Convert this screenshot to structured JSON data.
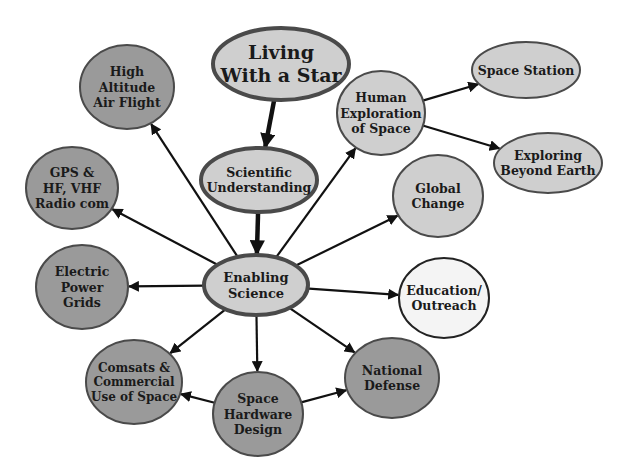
{
  "colors": {
    "dark_fill": "#9a9a9a",
    "light_fill": "#cfcfcf",
    "white_fill": "#f4f4f4",
    "stroke": "#4a4a4a",
    "arrow": "#111111",
    "text": "#1a1a1a"
  },
  "nodes": [
    {
      "id": "living",
      "lines": [
        "Living",
        "With a Star"
      ],
      "cx": 281,
      "cy": 64,
      "rx": 68,
      "ry": 36,
      "fill": "light",
      "size": 19,
      "sw": 4
    },
    {
      "id": "scientific",
      "lines": [
        "Scientific",
        "Understanding"
      ],
      "cx": 259,
      "cy": 180,
      "rx": 58,
      "ry": 32,
      "fill": "light",
      "size": 12.5,
      "sw": 4
    },
    {
      "id": "enabling",
      "lines": [
        "Enabling",
        "Science"
      ],
      "cx": 256,
      "cy": 285,
      "rx": 52,
      "ry": 30,
      "fill": "light",
      "size": 13,
      "sw": 4
    },
    {
      "id": "high-altitude",
      "lines": [
        "High",
        "Altitude",
        "Air Flight"
      ],
      "cx": 127,
      "cy": 87,
      "rx": 47,
      "ry": 42,
      "fill": "dark",
      "size": 12.5,
      "sw": 2
    },
    {
      "id": "gps",
      "lines": [
        "GPS &",
        "HF, VHF",
        "Radio com"
      ],
      "cx": 72,
      "cy": 188,
      "rx": 46,
      "ry": 41,
      "fill": "dark",
      "size": 12.5,
      "sw": 2
    },
    {
      "id": "electric",
      "lines": [
        "Electric",
        "Power",
        "Grids"
      ],
      "cx": 82,
      "cy": 287,
      "rx": 46,
      "ry": 42,
      "fill": "dark",
      "size": 12.5,
      "sw": 2
    },
    {
      "id": "comsats",
      "lines": [
        "Comsats &",
        "Commercial",
        "Use of Space"
      ],
      "cx": 134,
      "cy": 382,
      "rx": 48,
      "ry": 42,
      "fill": "dark",
      "size": 12,
      "sw": 2
    },
    {
      "id": "hardware",
      "lines": [
        "Space",
        "Hardware",
        "Design"
      ],
      "cx": 258,
      "cy": 414,
      "rx": 45,
      "ry": 42,
      "fill": "dark",
      "size": 12.5,
      "sw": 2
    },
    {
      "id": "defense",
      "lines": [
        "National",
        "Defense"
      ],
      "cx": 392,
      "cy": 378,
      "rx": 47,
      "ry": 40,
      "fill": "dark",
      "size": 12.5,
      "sw": 2
    },
    {
      "id": "education",
      "lines": [
        "Education/",
        "Outreach"
      ],
      "cx": 444,
      "cy": 298,
      "rx": 45,
      "ry": 40,
      "fill": "white",
      "size": 12.5,
      "sw": 2
    },
    {
      "id": "global",
      "lines": [
        "Global",
        "Change"
      ],
      "cx": 438,
      "cy": 196,
      "rx": 45,
      "ry": 41,
      "fill": "light",
      "size": 12.5,
      "sw": 2
    },
    {
      "id": "human",
      "lines": [
        "Human",
        "Exploration",
        "of Space"
      ],
      "cx": 381,
      "cy": 113,
      "rx": 44,
      "ry": 42,
      "fill": "light",
      "size": 12.5,
      "sw": 2
    },
    {
      "id": "station",
      "lines": [
        "Space Station"
      ],
      "cx": 526,
      "cy": 70,
      "rx": 54,
      "ry": 28,
      "fill": "light",
      "size": 12.5,
      "sw": 2
    },
    {
      "id": "beyond",
      "lines": [
        "Exploring",
        "Beyond Earth"
      ],
      "cx": 548,
      "cy": 163,
      "rx": 54,
      "ry": 30,
      "fill": "light",
      "size": 12.5,
      "sw": 2
    }
  ],
  "edges": [
    {
      "from": "living",
      "to": "scientific",
      "heavy": true
    },
    {
      "from": "scientific",
      "to": "enabling",
      "heavy": true
    },
    {
      "from": "enabling",
      "to": "high-altitude"
    },
    {
      "from": "enabling",
      "to": "gps"
    },
    {
      "from": "enabling",
      "to": "electric"
    },
    {
      "from": "enabling",
      "to": "comsats"
    },
    {
      "from": "enabling",
      "to": "hardware"
    },
    {
      "from": "enabling",
      "to": "defense"
    },
    {
      "from": "enabling",
      "to": "education"
    },
    {
      "from": "enabling",
      "to": "global"
    },
    {
      "from": "enabling",
      "to": "human"
    },
    {
      "from": "human",
      "to": "station"
    },
    {
      "from": "human",
      "to": "beyond"
    },
    {
      "from": "hardware",
      "to": "comsats"
    },
    {
      "from": "hardware",
      "to": "defense"
    }
  ]
}
